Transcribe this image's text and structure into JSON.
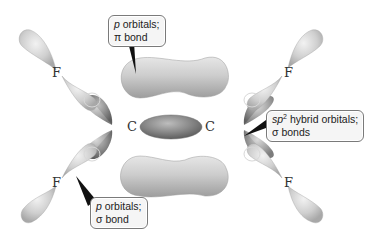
{
  "diagram": {
    "atoms": {
      "carbon_left": "C",
      "carbon_right": "C",
      "fluorine_top_left": "F",
      "fluorine_top_right": "F",
      "fluorine_bottom_left": "F",
      "fluorine_bottom_right": "F"
    },
    "labels": {
      "pi_bond": {
        "line1_italic": "p",
        "line1_rest": " orbitals;",
        "line2": "π bond"
      },
      "sp2_sigma": {
        "line1_italic": "sp",
        "line1_sup": "2",
        "line1_rest": " hybrid orbitals;",
        "line2": "σ bonds"
      },
      "p_sigma": {
        "line1_italic": "p",
        "line1_rest": " orbitals;",
        "line2": "σ bond"
      }
    },
    "colors": {
      "background": "#ffffff",
      "lobe_light": "#dcdcdc",
      "lobe_mid": "#b5b5b5",
      "lobe_dark": "#8a8a8a",
      "callout_fill": "#f5f5f5",
      "callout_border": "#7a7a7a",
      "pointer": "#111111"
    }
  }
}
